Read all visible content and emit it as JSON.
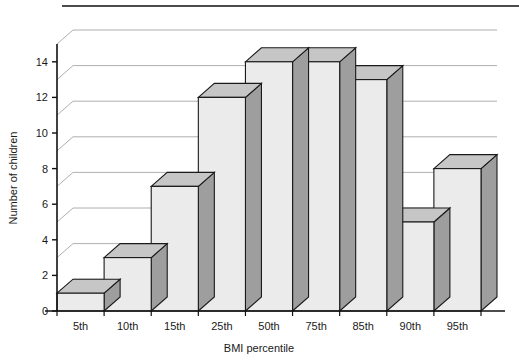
{
  "chart_data": {
    "type": "bar",
    "title": "",
    "subtitle": "",
    "xlabel": "BMI percentile",
    "ylabel": "Number of children",
    "categories": [
      "5th",
      "10th",
      "15th",
      "25th",
      "50th",
      "75th",
      "85th",
      "90th",
      "95th"
    ],
    "values": [
      1,
      3,
      7,
      12,
      14,
      14,
      13,
      5,
      8
    ],
    "series": [
      {
        "name": "Number of children",
        "values": [
          1,
          3,
          7,
          12,
          14,
          14,
          13,
          5,
          8
        ]
      }
    ],
    "ylim": [
      0,
      15
    ],
    "xlim": [
      0,
      9
    ],
    "ytick_values": [
      0,
      2,
      4,
      6,
      8,
      10,
      12,
      14
    ],
    "ytick_labels": [
      "0",
      "2",
      "4",
      "6",
      "8",
      "10",
      "12",
      "14"
    ],
    "gridlines": [
      1,
      3,
      5,
      7,
      9,
      11,
      13,
      15
    ],
    "grid": true,
    "grid_axis": "y",
    "legend": false,
    "legend_position": "none",
    "style": "3d-bar",
    "annotations": [],
    "colors": {
      "bar_front": "#ebebeb",
      "bar_top": "#c6c6c6",
      "bar_side": "#9e9e9e",
      "bar_edge": "#1a1a1a",
      "gridline": "#9a9a9a",
      "axis": "#111111",
      "background": "#ffffff",
      "text": "#1a1a1a",
      "rule": "#111111"
    }
  },
  "figure": {
    "top_rule_label": "top-divider-rule"
  }
}
